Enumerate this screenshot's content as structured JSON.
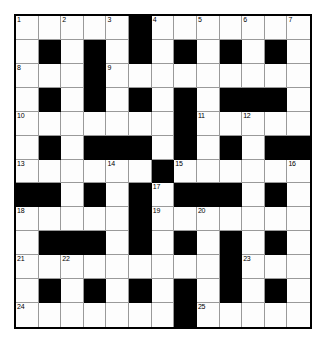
{
  "puzzle": {
    "type": "crossword-grid",
    "rows": 13,
    "columns": 13,
    "colors": {
      "block": "#000000",
      "cell": "#fdfdfd",
      "grid_line": "#9a9a9a",
      "border": "#000000",
      "number_text": "#000000",
      "page_background": "#ffffff"
    },
    "legend": {
      "white": "open letter square",
      "black": "blocked square"
    },
    "grid": [
      [
        "W",
        "W",
        "W",
        "W",
        "W",
        "B",
        "W",
        "W",
        "W",
        "W",
        "W",
        "W",
        "W"
      ],
      [
        "W",
        "B",
        "W",
        "B",
        "W",
        "B",
        "W",
        "B",
        "W",
        "B",
        "W",
        "B",
        "W"
      ],
      [
        "W",
        "W",
        "W",
        "B",
        "W",
        "W",
        "W",
        "W",
        "W",
        "W",
        "W",
        "W",
        "W"
      ],
      [
        "W",
        "B",
        "W",
        "B",
        "W",
        "B",
        "W",
        "B",
        "W",
        "B",
        "B",
        "B",
        "W"
      ],
      [
        "W",
        "W",
        "W",
        "W",
        "W",
        "W",
        "W",
        "B",
        "W",
        "W",
        "W",
        "W",
        "W"
      ],
      [
        "W",
        "B",
        "W",
        "B",
        "B",
        "B",
        "W",
        "B",
        "W",
        "B",
        "W",
        "B",
        "B"
      ],
      [
        "W",
        "W",
        "W",
        "W",
        "W",
        "W",
        "B",
        "W",
        "W",
        "W",
        "W",
        "W",
        "W"
      ],
      [
        "B",
        "B",
        "W",
        "B",
        "W",
        "B",
        "W",
        "B",
        "B",
        "B",
        "W",
        "B",
        "W"
      ],
      [
        "W",
        "W",
        "W",
        "W",
        "W",
        "B",
        "W",
        "W",
        "W",
        "W",
        "W",
        "W",
        "W"
      ],
      [
        "W",
        "B",
        "B",
        "B",
        "W",
        "B",
        "W",
        "B",
        "W",
        "B",
        "W",
        "B",
        "W"
      ],
      [
        "W",
        "W",
        "W",
        "W",
        "W",
        "W",
        "W",
        "W",
        "W",
        "B",
        "W",
        "W",
        "W"
      ],
      [
        "W",
        "B",
        "W",
        "B",
        "W",
        "B",
        "W",
        "B",
        "W",
        "B",
        "W",
        "B",
        "W"
      ],
      [
        "W",
        "W",
        "W",
        "W",
        "W",
        "W",
        "W",
        "B",
        "W",
        "W",
        "W",
        "W",
        "W"
      ]
    ],
    "numbers": [
      {
        "number": "1",
        "row": 1,
        "col": 1
      },
      {
        "number": "2",
        "row": 1,
        "col": 3
      },
      {
        "number": "3",
        "row": 1,
        "col": 5
      },
      {
        "number": "4",
        "row": 1,
        "col": 7
      },
      {
        "number": "5",
        "row": 1,
        "col": 9
      },
      {
        "number": "6",
        "row": 1,
        "col": 11
      },
      {
        "number": "7",
        "row": 1,
        "col": 13
      },
      {
        "number": "8",
        "row": 3,
        "col": 1
      },
      {
        "number": "9",
        "row": 3,
        "col": 5
      },
      {
        "number": "10",
        "row": 5,
        "col": 1
      },
      {
        "number": "11",
        "row": 5,
        "col": 9
      },
      {
        "number": "12",
        "row": 5,
        "col": 11
      },
      {
        "number": "13",
        "row": 7,
        "col": 1
      },
      {
        "number": "14",
        "row": 7,
        "col": 5
      },
      {
        "number": "15",
        "row": 7,
        "col": 8
      },
      {
        "number": "16",
        "row": 7,
        "col": 13
      },
      {
        "number": "17",
        "row": 8,
        "col": 7
      },
      {
        "number": "18",
        "row": 9,
        "col": 1
      },
      {
        "number": "19",
        "row": 9,
        "col": 7
      },
      {
        "number": "20",
        "row": 9,
        "col": 9
      },
      {
        "number": "21",
        "row": 11,
        "col": 1
      },
      {
        "number": "22",
        "row": 11,
        "col": 3
      },
      {
        "number": "23",
        "row": 11,
        "col": 11
      },
      {
        "number": "24",
        "row": 13,
        "col": 1
      },
      {
        "number": "25",
        "row": 13,
        "col": 9
      }
    ]
  }
}
